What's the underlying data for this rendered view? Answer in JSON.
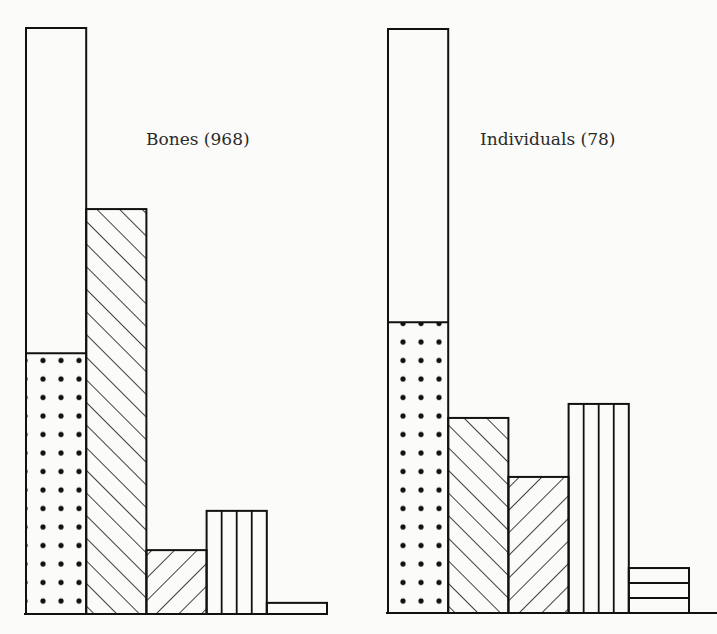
{
  "chart_data": {
    "type": "bar",
    "title": "",
    "xlabel": "",
    "ylabel": "",
    "ylim": [
      0,
      100
    ],
    "units": "percent of panel total (estimated from bar heights; no axis printed)",
    "grid": false,
    "legend": "none",
    "panels": [
      {
        "label": "Bones (968)",
        "name": "Bones",
        "n": 968,
        "bars": [
          {
            "pattern": "empty",
            "value": 100,
            "note": "outline total"
          },
          {
            "pattern": "dotted",
            "value": 44.5
          },
          {
            "pattern": "diagonal-right",
            "value": 69.1
          },
          {
            "pattern": "diagonal-left",
            "value": 10.9
          },
          {
            "pattern": "vertical-lines",
            "value": 17.6
          },
          {
            "pattern": "horizontal-lines",
            "value": 1.9
          }
        ]
      },
      {
        "label": "Individuals (78)",
        "name": "Individuals",
        "n": 78,
        "bars": [
          {
            "pattern": "empty",
            "value": 100,
            "note": "outline total"
          },
          {
            "pattern": "dotted",
            "value": 49.8
          },
          {
            "pattern": "diagonal-right",
            "value": 33.4
          },
          {
            "pattern": "diagonal-left",
            "value": 23.3
          },
          {
            "pattern": "vertical-lines",
            "value": 35.8
          },
          {
            "pattern": "horizontal-lines",
            "value": 7.7
          }
        ]
      }
    ]
  },
  "colors": {
    "ink": "#111111",
    "paper": "#fbfbf9"
  }
}
